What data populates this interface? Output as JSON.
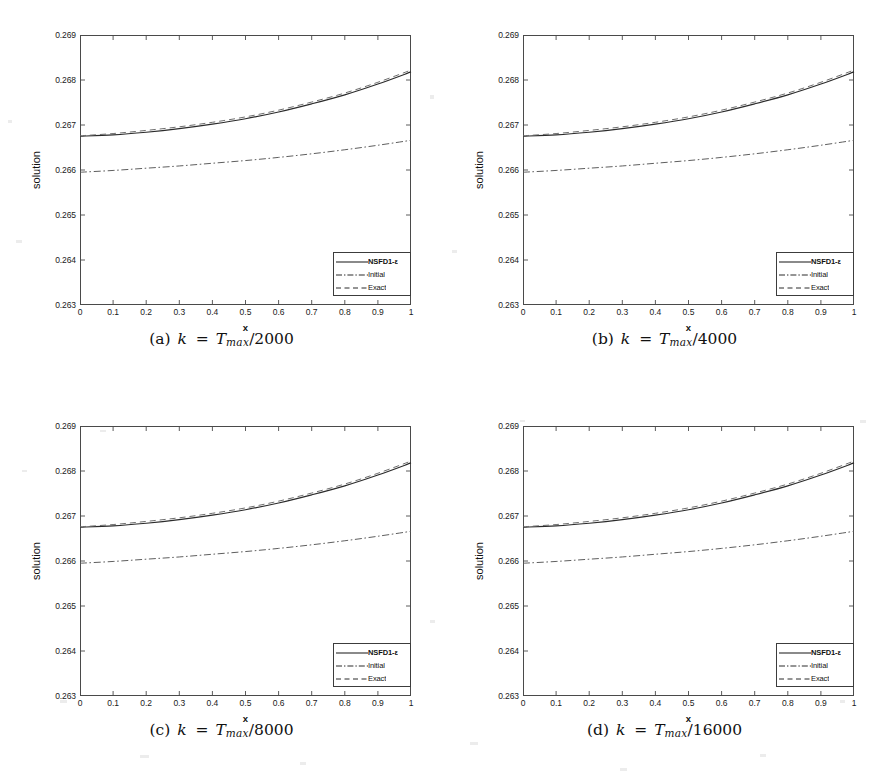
{
  "figure": {
    "panel_count": 4,
    "axis": {
      "xlabel": "x",
      "ylabel": "solution",
      "xticks": [
        "0",
        "0.1",
        "0.2",
        "0.3",
        "0.4",
        "0.5",
        "0.6",
        "0.7",
        "0.8",
        "0.9",
        "1"
      ],
      "yticks": [
        "0.263",
        "0.264",
        "0.265",
        "0.266",
        "0.267",
        "0.268",
        "0.269"
      ]
    },
    "legend": {
      "items": [
        {
          "label": "NSFD1-ε",
          "style": "solid"
        },
        {
          "label": "Initial",
          "style": "dashdot"
        },
        {
          "label": "Exact",
          "style": "dashed"
        }
      ]
    },
    "panels": [
      {
        "id": "a",
        "caption_label": "(a)",
        "caption_var": "k",
        "caption_eq": "=",
        "caption_sym": "T",
        "caption_sub": "max",
        "caption_slash": "/",
        "caption_den": "2000"
      },
      {
        "id": "b",
        "caption_label": "(b)",
        "caption_var": "k",
        "caption_eq": "=",
        "caption_sym": "T",
        "caption_sub": "max",
        "caption_slash": "/",
        "caption_den": "4000"
      },
      {
        "id": "c",
        "caption_label": "(c)",
        "caption_var": "k",
        "caption_eq": "=",
        "caption_sym": "T",
        "caption_sub": "max",
        "caption_slash": "/",
        "caption_den": "8000"
      },
      {
        "id": "d",
        "caption_label": "(d)",
        "caption_var": "k",
        "caption_eq": "=",
        "caption_sym": "T",
        "caption_sub": "max",
        "caption_slash": "/",
        "caption_den": "16000"
      }
    ]
  },
  "chart_data": [
    {
      "type": "line",
      "title": "(a) k = T_max/2000",
      "xlabel": "x",
      "ylabel": "solution",
      "xlim": [
        0,
        1
      ],
      "ylim": [
        0.263,
        0.269
      ],
      "xticks": [
        0,
        0.1,
        0.2,
        0.3,
        0.4,
        0.5,
        0.6,
        0.7,
        0.8,
        0.9,
        1
      ],
      "yticks": [
        0.263,
        0.264,
        0.265,
        0.266,
        0.267,
        0.268,
        0.269
      ],
      "grid": false,
      "legend_position": "lower right",
      "x": [
        0,
        0.1,
        0.2,
        0.3,
        0.4,
        0.5,
        0.6,
        0.7,
        0.8,
        0.9,
        1
      ],
      "series": [
        {
          "name": "NSFD1-ε",
          "style": "solid",
          "values": [
            0.26675,
            0.26678,
            0.26684,
            0.26692,
            0.26702,
            0.26714,
            0.26729,
            0.26747,
            0.26767,
            0.26791,
            0.26818
          ]
        },
        {
          "name": "Initial",
          "style": "dashdot",
          "values": [
            0.26595,
            0.26599,
            0.26604,
            0.26609,
            0.26615,
            0.26621,
            0.26628,
            0.26636,
            0.26645,
            0.26655,
            0.26666
          ]
        },
        {
          "name": "Exact",
          "style": "dashed",
          "values": [
            0.26676,
            0.26681,
            0.26688,
            0.26696,
            0.26706,
            0.26718,
            0.26733,
            0.26751,
            0.26771,
            0.26795,
            0.26822
          ]
        }
      ]
    },
    {
      "type": "line",
      "title": "(b) k = T_max/4000",
      "xlabel": "x",
      "ylabel": "solution",
      "xlim": [
        0,
        1
      ],
      "ylim": [
        0.263,
        0.269
      ],
      "xticks": [
        0,
        0.1,
        0.2,
        0.3,
        0.4,
        0.5,
        0.6,
        0.7,
        0.8,
        0.9,
        1
      ],
      "yticks": [
        0.263,
        0.264,
        0.265,
        0.266,
        0.267,
        0.268,
        0.269
      ],
      "grid": false,
      "legend_position": "lower right",
      "x": [
        0,
        0.1,
        0.2,
        0.3,
        0.4,
        0.5,
        0.6,
        0.7,
        0.8,
        0.9,
        1
      ],
      "series": [
        {
          "name": "NSFD1-ε",
          "style": "solid",
          "values": [
            0.26675,
            0.26678,
            0.26684,
            0.26692,
            0.26702,
            0.26714,
            0.26729,
            0.26747,
            0.26767,
            0.26791,
            0.26818
          ]
        },
        {
          "name": "Initial",
          "style": "dashdot",
          "values": [
            0.26595,
            0.26599,
            0.26604,
            0.26609,
            0.26615,
            0.26621,
            0.26628,
            0.26636,
            0.26645,
            0.26655,
            0.26666
          ]
        },
        {
          "name": "Exact",
          "style": "dashed",
          "values": [
            0.26676,
            0.26681,
            0.26688,
            0.26696,
            0.26706,
            0.26718,
            0.26733,
            0.26751,
            0.26771,
            0.26795,
            0.26822
          ]
        }
      ]
    },
    {
      "type": "line",
      "title": "(c) k = T_max/8000",
      "xlabel": "x",
      "ylabel": "solution",
      "xlim": [
        0,
        1
      ],
      "ylim": [
        0.263,
        0.269
      ],
      "xticks": [
        0,
        0.1,
        0.2,
        0.3,
        0.4,
        0.5,
        0.6,
        0.7,
        0.8,
        0.9,
        1
      ],
      "yticks": [
        0.263,
        0.264,
        0.265,
        0.266,
        0.267,
        0.268,
        0.269
      ],
      "grid": false,
      "legend_position": "lower right",
      "x": [
        0,
        0.1,
        0.2,
        0.3,
        0.4,
        0.5,
        0.6,
        0.7,
        0.8,
        0.9,
        1
      ],
      "series": [
        {
          "name": "NSFD1-ε",
          "style": "solid",
          "values": [
            0.26675,
            0.26678,
            0.26684,
            0.26692,
            0.26702,
            0.26714,
            0.26729,
            0.26747,
            0.26767,
            0.26791,
            0.26818
          ]
        },
        {
          "name": "Initial",
          "style": "dashdot",
          "values": [
            0.26595,
            0.26599,
            0.26604,
            0.26609,
            0.26615,
            0.26621,
            0.26628,
            0.26636,
            0.26645,
            0.26655,
            0.26666
          ]
        },
        {
          "name": "Exact",
          "style": "dashed",
          "values": [
            0.26676,
            0.26681,
            0.26688,
            0.26696,
            0.26706,
            0.26718,
            0.26733,
            0.26751,
            0.26771,
            0.26795,
            0.26822
          ]
        }
      ]
    },
    {
      "type": "line",
      "title": "(d) k = T_max/16000",
      "xlabel": "x",
      "ylabel": "solution",
      "xlim": [
        0,
        1
      ],
      "ylim": [
        0.263,
        0.269
      ],
      "xticks": [
        0,
        0.1,
        0.2,
        0.3,
        0.4,
        0.5,
        0.6,
        0.7,
        0.8,
        0.9,
        1
      ],
      "yticks": [
        0.263,
        0.264,
        0.265,
        0.266,
        0.267,
        0.268,
        0.269
      ],
      "grid": false,
      "legend_position": "lower right",
      "x": [
        0,
        0.1,
        0.2,
        0.3,
        0.4,
        0.5,
        0.6,
        0.7,
        0.8,
        0.9,
        1
      ],
      "series": [
        {
          "name": "NSFD1-ε",
          "style": "solid",
          "values": [
            0.26675,
            0.26678,
            0.26684,
            0.26692,
            0.26702,
            0.26714,
            0.26729,
            0.26747,
            0.26767,
            0.26791,
            0.26818
          ]
        },
        {
          "name": "Initial",
          "style": "dashdot",
          "values": [
            0.26595,
            0.26599,
            0.26604,
            0.26609,
            0.26615,
            0.26621,
            0.26628,
            0.26636,
            0.26645,
            0.26655,
            0.26666
          ]
        },
        {
          "name": "Exact",
          "style": "dashed",
          "values": [
            0.26676,
            0.26681,
            0.26688,
            0.26696,
            0.26706,
            0.26718,
            0.26733,
            0.26751,
            0.26771,
            0.26795,
            0.26822
          ]
        }
      ]
    }
  ]
}
